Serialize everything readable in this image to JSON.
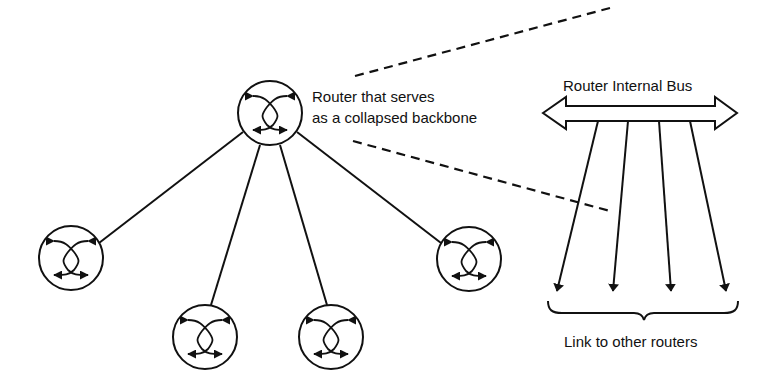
{
  "diagram": {
    "colors": {
      "stroke": "#111111",
      "background": "#ffffff"
    },
    "central_router": {
      "label_line1": "Router that serves",
      "label_line2": "as a collapsed backbone",
      "icon": "router-icon"
    },
    "edge_routers": [
      {
        "id": "router-left",
        "icon": "router-icon"
      },
      {
        "id": "router-bottom-left",
        "icon": "router-icon"
      },
      {
        "id": "router-bottom-right",
        "icon": "router-icon"
      },
      {
        "id": "router-right",
        "icon": "router-icon"
      }
    ],
    "detail_view": {
      "bus_label": "Router Internal Bus",
      "bus_icon": "double-headed-arrow-icon",
      "link_count": 4,
      "links_label": "Link to other routers",
      "brace_icon": "curly-brace-icon"
    }
  }
}
